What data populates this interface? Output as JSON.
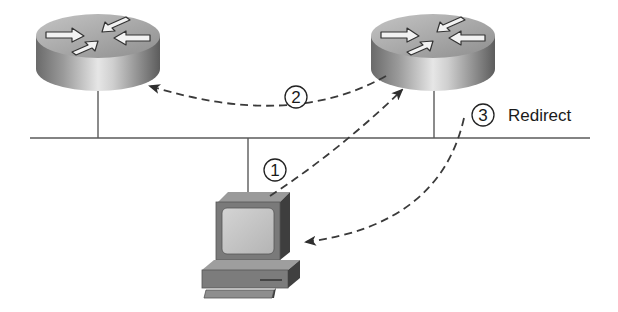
{
  "diagram": {
    "type": "network-redirect",
    "nodes": [
      {
        "id": "router-left",
        "kind": "router",
        "label": ""
      },
      {
        "id": "router-right",
        "kind": "router",
        "label": ""
      },
      {
        "id": "host-pc",
        "kind": "workstation",
        "label": ""
      }
    ],
    "segment": {
      "kind": "lan-segment"
    },
    "steps": [
      {
        "number": "1",
        "from": "host-pc",
        "to": "router-right",
        "label": ""
      },
      {
        "number": "2",
        "from": "router-right",
        "to": "router-left",
        "label": ""
      },
      {
        "number": "3",
        "from": "router-right",
        "to": "host-pc",
        "label": "Redirect"
      }
    ],
    "colors": {
      "line": "#5a5a5a",
      "arrow": "#3a3a3a",
      "router_body_light": "#d8d8d8",
      "router_body_dark": "#707070",
      "router_top": "#a8a8a8",
      "pc_body": "#8c8c8c",
      "pc_screen": "#c8c8c8",
      "pc_dark": "#4a4a4a"
    }
  }
}
